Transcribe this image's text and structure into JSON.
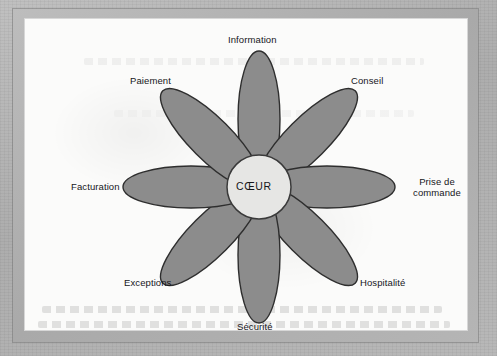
{
  "figure": {
    "type": "flower-diagram",
    "center": {
      "label": "CŒUR",
      "fill_color": "#e6e6e4",
      "stroke_color": "#3a3a3a"
    },
    "petal_style": {
      "fill_color": "#8c8c8c",
      "stroke_color": "#2e2e2e"
    },
    "background_color": "#fbfbfa",
    "frame_color": "#b0b0b0",
    "petals": [
      {
        "id": "information",
        "label": "Information",
        "angle_deg": 0,
        "label_lines": [
          "Information"
        ]
      },
      {
        "id": "conseil",
        "label": "Conseil",
        "angle_deg": 45,
        "label_lines": [
          "Conseil"
        ]
      },
      {
        "id": "prise-commande",
        "label": "Prise de commande",
        "angle_deg": 90,
        "label_lines": [
          "Prise de",
          "commande"
        ]
      },
      {
        "id": "hospitalite",
        "label": "Hospitalité",
        "angle_deg": 135,
        "label_lines": [
          "Hospitalité"
        ]
      },
      {
        "id": "securite",
        "label": "Sécurité",
        "angle_deg": 180,
        "label_lines": [
          "Sécurité"
        ]
      },
      {
        "id": "exceptions",
        "label": "Exceptions",
        "angle_deg": 225,
        "label_lines": [
          "Exceptions"
        ]
      },
      {
        "id": "facturation",
        "label": "Facturation",
        "angle_deg": 270,
        "label_lines": [
          "Facturation"
        ]
      },
      {
        "id": "paiement",
        "label": "Paiement",
        "angle_deg": 315,
        "label_lines": [
          "Paiement"
        ]
      }
    ]
  },
  "labels": {
    "information": "Information",
    "conseil": "Conseil",
    "prise_de_commande_line1": "Prise de",
    "prise_de_commande_line2": "commande",
    "hospitalite": "Hospitalité",
    "securite": "Sécurité",
    "exceptions": "Exceptions",
    "facturation": "Facturation",
    "paiement": "Paiement",
    "coeur": "CŒUR"
  }
}
